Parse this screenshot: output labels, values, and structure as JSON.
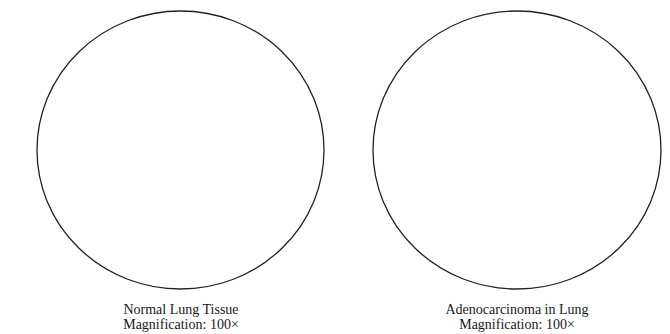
{
  "panels": [
    {
      "title": "Normal Lung Tissue",
      "magnification": "Magnification: 100×"
    },
    {
      "title": "Adenocarcinoma in Lung",
      "magnification": "Magnification: 100×"
    }
  ],
  "style": {
    "stroke_color": "#222222",
    "background": "#ffffff"
  }
}
